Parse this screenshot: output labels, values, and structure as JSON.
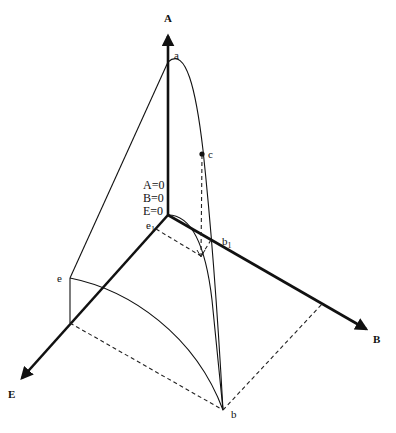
{
  "diagram": {
    "type": "3D phase diagram (three-component axes)",
    "axes": {
      "A": {
        "label": "A"
      },
      "B": {
        "label": "B"
      },
      "E": {
        "label": "E"
      }
    },
    "origin_conditions": [
      "A=0",
      "B=0",
      "E=0"
    ],
    "points": {
      "a": {
        "label": "a"
      },
      "b": {
        "label": "b"
      },
      "c": {
        "label": "c"
      },
      "e": {
        "label": "e"
      },
      "e1": {
        "label": "e",
        "sub": "1"
      },
      "b1": {
        "label": "b",
        "sub": "1"
      }
    },
    "colors": {
      "ink": "#111111",
      "background": "#ffffff"
    }
  }
}
